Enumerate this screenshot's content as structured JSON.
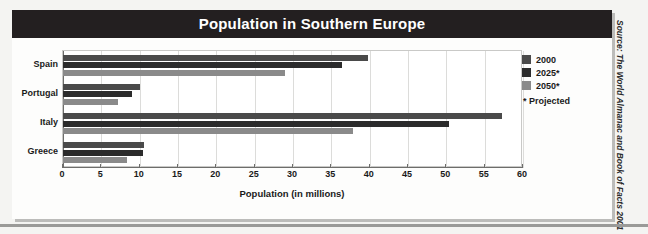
{
  "chart_data": {
    "type": "bar",
    "orientation": "horizontal",
    "title": "Population in Southern Europe",
    "xlabel": "Population (in millions)",
    "ylabel": "",
    "xlim": [
      0,
      60
    ],
    "xticks": [
      0,
      5,
      10,
      15,
      20,
      25,
      30,
      35,
      40,
      45,
      50,
      55,
      60
    ],
    "grid": true,
    "legend_position": "top-right",
    "categories": [
      "Spain",
      "Portugal",
      "Italy",
      "Greece"
    ],
    "series": [
      {
        "name": "2000",
        "color": "#4a4a4a",
        "values": [
          39.8,
          10.0,
          57.2,
          10.6
        ]
      },
      {
        "name": "2025*",
        "color": "#2b2b2b",
        "values": [
          36.4,
          9.0,
          50.3,
          10.4
        ]
      },
      {
        "name": "2050*",
        "color": "#8a8a8a",
        "values": [
          29.0,
          7.2,
          37.8,
          8.3
        ]
      }
    ],
    "legend_note": "* Projected",
    "source": "Source: The World Almanac and Book of Facts 2001"
  },
  "colors": {
    "title_banner": "#231f20",
    "title_text": "#ffffff",
    "plot_background": "#ffffff",
    "page_background": "#f4f4f2",
    "gridline": "#dcdcda",
    "axis": "#6d6d6b"
  }
}
